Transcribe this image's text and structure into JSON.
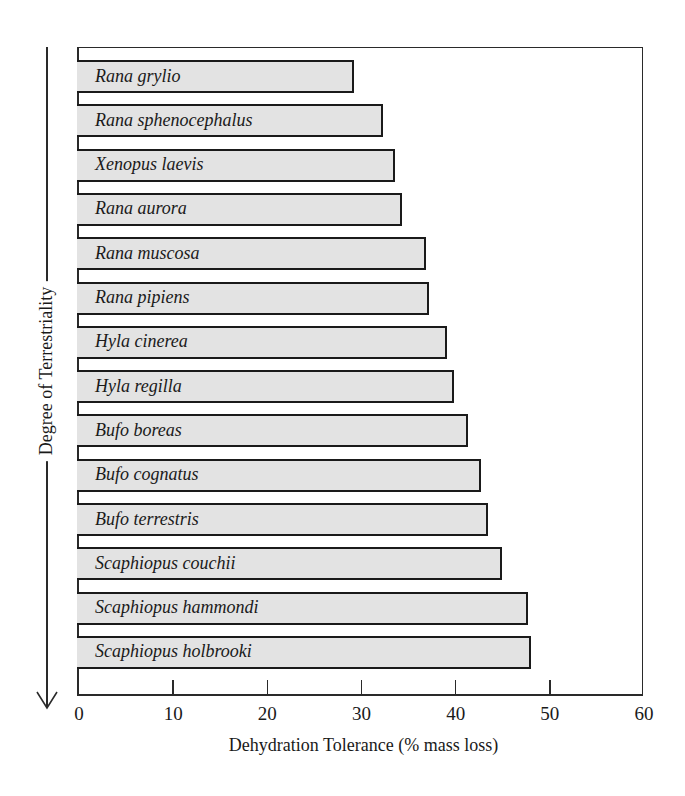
{
  "chart_data": {
    "type": "bar",
    "orientation": "horizontal",
    "title": "",
    "xlabel": "Dehydration Tolerance (% mass loss)",
    "ylabel": "Degree of Terrestriality",
    "ylabel_direction": "increasing downward (arrow pointing down)",
    "xlim": [
      0,
      60
    ],
    "xticks": [
      0,
      10,
      20,
      30,
      40,
      50,
      60
    ],
    "grid": false,
    "legend": null,
    "categories": [
      "Rana grylio",
      "Rana sphenocephalus",
      "Xenopus laevis",
      "Rana aurora",
      "Rana muscosa",
      "Rana pipiens",
      "Hyla cinerea",
      "Hyla regilla",
      "Bufo boreas",
      "Bufo cognatus",
      "Bufo terrestris",
      "Scaphiopus couchii",
      "Scaphiopus hammondi",
      "Scaphiopus holbrooki"
    ],
    "values": [
      29.2,
      32.3,
      33.6,
      34.3,
      36.9,
      37.2,
      39.1,
      39.8,
      41.3,
      42.7,
      43.4,
      44.9,
      47.7,
      48.0
    ],
    "bar_fill": "#e3e3e3",
    "bar_edge": "#1a1a1a"
  },
  "axis": {
    "x_title": "Dehydration Tolerance (% mass loss)",
    "y_title": "Degree of Terrestriality",
    "tick_labels": [
      "0",
      "10",
      "20",
      "30",
      "40",
      "50",
      "60"
    ]
  }
}
